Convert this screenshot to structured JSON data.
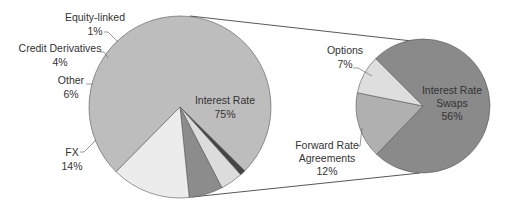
{
  "chart_data": {
    "type": "pie",
    "subtype": "pie-of-pie",
    "title": "",
    "primary_pie": {
      "center": [
        180,
        107
      ],
      "radius": 91,
      "start_angle_deg": 224.6,
      "slices": [
        {
          "label": "Interest Rate",
          "value": 75,
          "pct_label": "75%",
          "color": "#bdbdbd"
        },
        {
          "label": "Equity-linked",
          "value": 1,
          "pct_label": "1%",
          "color": "#444444"
        },
        {
          "label": "Credit Derivatives",
          "value": 4,
          "pct_label": "4%",
          "color": "#dcdcdc"
        },
        {
          "label": "Other",
          "value": 6,
          "pct_label": "6%",
          "color": "#8c8c8c"
        },
        {
          "label": "FX",
          "value": 14,
          "pct_label": "14%",
          "color": "#ececec"
        }
      ]
    },
    "secondary_pie": {
      "breakdown_of": "Interest Rate",
      "center": [
        423,
        106
      ],
      "radius": 67,
      "start_angle_deg": 315,
      "slices": [
        {
          "label": "Interest Rate Swaps",
          "value": 56,
          "pct_label": "56%",
          "color": "#8a8a8a"
        },
        {
          "label": "Forward Rate Agreements",
          "value": 12,
          "pct_label": "12%",
          "color": "#b0b0b0"
        },
        {
          "label": "Options",
          "value": 7,
          "pct_label": "7%",
          "color": "#dedede"
        }
      ]
    },
    "connectors": [
      {
        "from": [
          190,
          16
        ],
        "to": [
          412,
          41
        ]
      },
      {
        "from": [
          192,
          197
        ],
        "to": [
          420,
          173
        ]
      }
    ]
  },
  "labels": {
    "equity": {
      "name": "Equity-linked",
      "pct": "1%"
    },
    "credit": {
      "name": "Credit Derivatives",
      "pct": "4%"
    },
    "other": {
      "name": "Other",
      "pct": "6%"
    },
    "fx": {
      "name": "FX",
      "pct": "14%"
    },
    "interest": {
      "name": "Interest Rate",
      "pct": "75%"
    },
    "options": {
      "name": "Options",
      "pct": "7%"
    },
    "fra": {
      "name1": "Forward Rate",
      "name2": "Agreements",
      "pct": "12%"
    },
    "swaps": {
      "name1": "Interest Rate",
      "name2": "Swaps",
      "pct": "56%"
    }
  }
}
